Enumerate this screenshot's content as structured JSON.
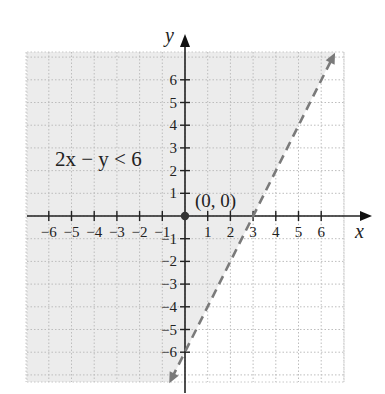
{
  "chart_data": {
    "type": "line",
    "title": "",
    "inequality_label": "2x − y < 6",
    "boundary": {
      "equation": "y = 2x - 6",
      "style": "dashed",
      "color": "#7a7a7a",
      "slope": 2,
      "intercept": -6,
      "x_intercept": 3,
      "y_intercept": -6,
      "arrows": "both"
    },
    "shaded_region": {
      "side": "above-left of line (contains origin)",
      "color": "#ececec"
    },
    "test_point": {
      "x": 0,
      "y": 0,
      "label": "(0, 0)"
    },
    "xlabel": "x",
    "ylabel": "y",
    "xlim": [
      -7,
      7
    ],
    "ylim": [
      -7,
      7
    ],
    "x_ticks": [
      -6,
      -5,
      -4,
      -3,
      -2,
      -1,
      1,
      2,
      3,
      4,
      5,
      6
    ],
    "y_ticks": [
      -6,
      -5,
      -4,
      -3,
      -2,
      -1,
      1,
      2,
      3,
      4,
      5,
      6
    ],
    "x_tick_labels": [
      "−6",
      "−5",
      "−4",
      "−3",
      "−2",
      "−1",
      "1",
      "2",
      "3",
      "4",
      "5",
      "6"
    ],
    "y_tick_labels": [
      "−6",
      "−5",
      "−4",
      "−3",
      "−2",
      "−1",
      "1",
      "2",
      "3",
      "4",
      "5",
      "6"
    ],
    "grid": true,
    "grid_style": "dotted",
    "legend": null
  }
}
